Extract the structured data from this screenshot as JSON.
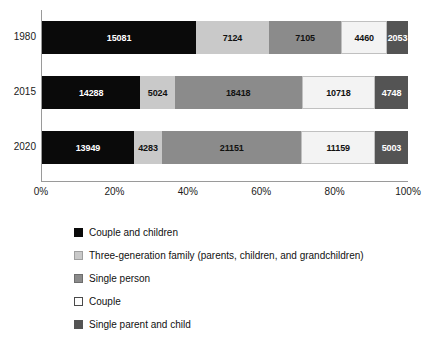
{
  "chart_data": {
    "type": "bar",
    "orientation": "horizontal",
    "stacked": true,
    "normalized": true,
    "title": "",
    "xlabel": "",
    "ylabel": "",
    "xlim": [
      0,
      100
    ],
    "grid": false,
    "legend_position": "bottom",
    "categories": [
      "1980",
      "2015",
      "2020"
    ],
    "xticks": [
      "0%",
      "20%",
      "40%",
      "60%",
      "80%",
      "100%"
    ],
    "xtick_values": [
      0,
      20,
      40,
      60,
      80,
      100
    ],
    "series": [
      {
        "name": "Couple and children",
        "color": "#0a0a0a",
        "values": [
          15081,
          14288,
          13949
        ]
      },
      {
        "name": "Three-generation family (parents, children, and grandchildren)",
        "color": "#c9c9c9",
        "values": [
          7124,
          5024,
          4283
        ]
      },
      {
        "name": "Single person",
        "color": "#8b8b8b",
        "values": [
          7105,
          18418,
          21151
        ]
      },
      {
        "name": "Couple",
        "color": "#f3f3f3",
        "values": [
          4460,
          10718,
          11159
        ]
      },
      {
        "name": "Single parent and child",
        "color": "#545454",
        "values": [
          2053,
          4748,
          5003
        ]
      }
    ],
    "row_totals": [
      35823,
      53196,
      55545
    ]
  },
  "rows": [
    {
      "year": "1980",
      "segments": [
        {
          "label": "15081",
          "pct": 42.1
        },
        {
          "label": "7124",
          "pct": 19.89
        },
        {
          "label": "7105",
          "pct": 19.83
        },
        {
          "label": "4460",
          "pct": 12.45
        },
        {
          "label": "2053",
          "pct": 5.73
        }
      ]
    },
    {
      "year": "2015",
      "segments": [
        {
          "label": "14288",
          "pct": 26.86
        },
        {
          "label": "5024",
          "pct": 9.44
        },
        {
          "label": "18418",
          "pct": 34.62
        },
        {
          "label": "10718",
          "pct": 20.15
        },
        {
          "label": "4748",
          "pct": 8.93
        }
      ]
    },
    {
      "year": "2020",
      "segments": [
        {
          "label": "13949",
          "pct": 25.11
        },
        {
          "label": "4283",
          "pct": 7.71
        },
        {
          "label": "21151",
          "pct": 38.08
        },
        {
          "label": "11159",
          "pct": 20.09
        },
        {
          "label": "5003",
          "pct": 9.01
        }
      ]
    }
  ],
  "legend": {
    "items": [
      {
        "label": "Couple and children"
      },
      {
        "label": "Three-generation family (parents, children, and grandchildren)"
      },
      {
        "label": "Single person"
      },
      {
        "label": "Couple"
      },
      {
        "label": "Single parent and child"
      }
    ]
  }
}
